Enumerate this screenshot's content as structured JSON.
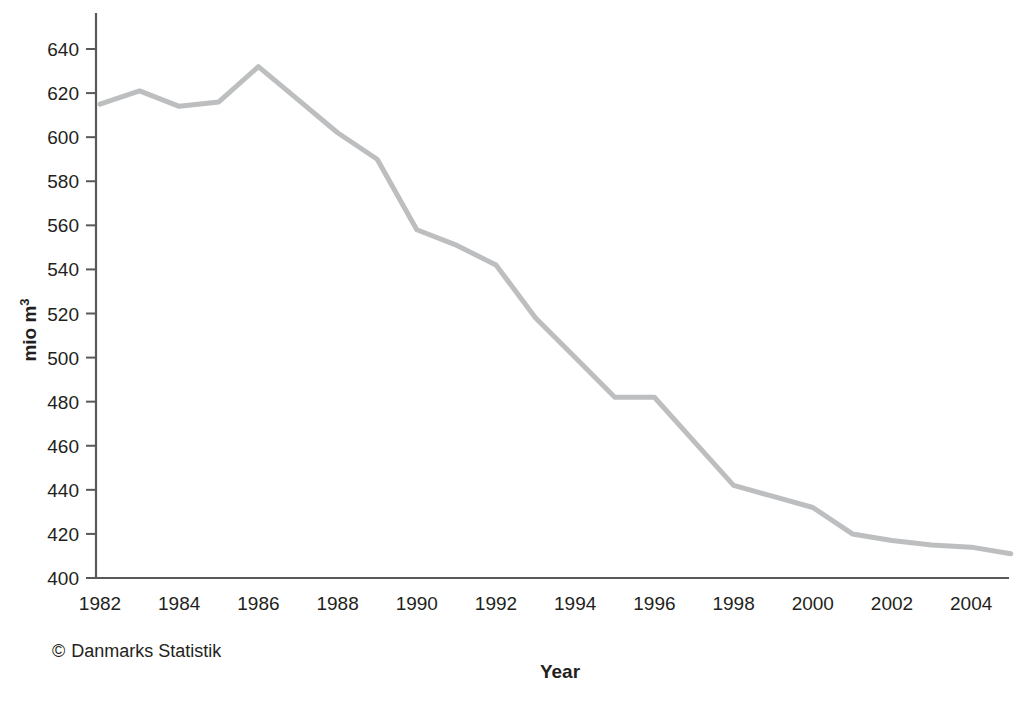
{
  "chart_data": {
    "type": "line",
    "title": "",
    "xlabel": "Year",
    "ylabel": "mio m³",
    "x": [
      1982,
      1983,
      1984,
      1985,
      1986,
      1987,
      1988,
      1989,
      1990,
      1991,
      1992,
      1993,
      1994,
      1995,
      1996,
      1997,
      1998,
      1999,
      2000,
      2001,
      2002,
      2003,
      2004,
      2005
    ],
    "values": [
      615,
      621,
      614,
      616,
      632,
      617,
      602,
      590,
      558,
      551,
      542,
      518,
      500,
      482,
      482,
      462,
      442,
      437,
      432,
      420,
      417,
      415,
      414,
      411
    ],
    "series": [
      {
        "name": "Water abstraction",
        "values": [
          615,
          621,
          614,
          616,
          632,
          617,
          602,
          590,
          558,
          551,
          542,
          518,
          500,
          482,
          482,
          462,
          442,
          437,
          432,
          420,
          417,
          415,
          414,
          411
        ]
      }
    ],
    "xlim": [
      1982,
      2005
    ],
    "ylim": [
      400,
      650
    ],
    "xticks": [
      1982,
      1984,
      1986,
      1988,
      1990,
      1992,
      1994,
      1996,
      1998,
      2000,
      2002,
      2004
    ],
    "yticks": [
      400,
      420,
      440,
      460,
      480,
      500,
      520,
      540,
      560,
      580,
      600,
      620,
      640
    ],
    "xtick_labels": [
      "1982",
      "1984",
      "1986",
      "1988",
      "1990",
      "1992",
      "1994",
      "1996",
      "1998",
      "2000",
      "2002",
      "2004"
    ],
    "ytick_labels": [
      "400",
      "420",
      "440",
      "460",
      "480",
      "500",
      "520",
      "540",
      "560",
      "580",
      "600",
      "620",
      "640"
    ],
    "grid": false,
    "legend": null,
    "line_color": "#bcbec0",
    "axis_color": "#58595b"
  },
  "axis": {
    "y_title_main": "mio m",
    "y_title_sup": "3",
    "x_title": "Year"
  },
  "credit": {
    "symbol": "©",
    "text": "Danmarks Statistik"
  }
}
